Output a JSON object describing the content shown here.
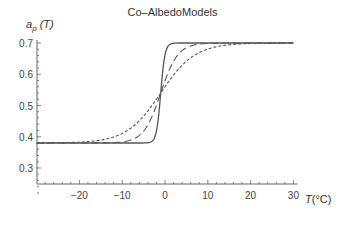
{
  "chart_data": {
    "type": "line",
    "title": "Co–AlbedoModels",
    "xlabel": "T(°C)",
    "ylabel": "a_p (T)",
    "xlim": [
      -30,
      30
    ],
    "ylim": [
      0.2,
      0.7
    ],
    "xticks": [
      -20,
      -10,
      0,
      10,
      20,
      30
    ],
    "yticks": [
      0.3,
      0.4,
      0.5,
      0.6,
      0.7
    ],
    "grid": false,
    "legend": null,
    "series": [
      {
        "name": "steep (solid)",
        "style": "solid",
        "model": "0.54 + 0.16*tanh((T+1)/1)",
        "points": [
          [
            -30,
            0.38
          ],
          [
            -5,
            0.38
          ],
          [
            -3,
            0.385
          ],
          [
            -2,
            0.42
          ],
          [
            -1,
            0.54
          ],
          [
            0,
            0.66
          ],
          [
            1,
            0.695
          ],
          [
            3,
            0.7
          ],
          [
            30,
            0.7
          ]
        ]
      },
      {
        "name": "medium (long dash)",
        "style": "long-dash",
        "model": "0.54 + 0.16*tanh((T+1)/4)",
        "points": [
          [
            -30,
            0.38
          ],
          [
            -15,
            0.381
          ],
          [
            -10,
            0.395
          ],
          [
            -5,
            0.44
          ],
          [
            -1,
            0.54
          ],
          [
            3,
            0.64
          ],
          [
            8,
            0.685
          ],
          [
            15,
            0.699
          ],
          [
            30,
            0.7
          ]
        ]
      },
      {
        "name": "wide (short dash)",
        "style": "short-dash",
        "model": "0.54 + 0.16*tanh((T+1)/8)",
        "points": [
          [
            -30,
            0.382
          ],
          [
            -20,
            0.39
          ],
          [
            -10,
            0.43
          ],
          [
            -5,
            0.48
          ],
          [
            -1,
            0.54
          ],
          [
            5,
            0.62
          ],
          [
            10,
            0.66
          ],
          [
            20,
            0.695
          ],
          [
            30,
            0.7
          ]
        ]
      }
    ]
  },
  "labels": {
    "title": "Co–AlbedoModels",
    "ylabel_main": "a",
    "ylabel_sub": "p",
    "ylabel_arg": " (T)",
    "xlabel_var": "T",
    "xlabel_unit": "(°C)"
  }
}
